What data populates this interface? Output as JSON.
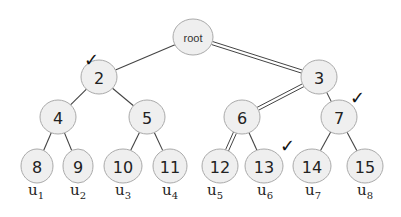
{
  "diagram": {
    "type": "binary-tree",
    "colors": {
      "node_fill": "#efefef",
      "node_stroke": "#aaaaaa",
      "edge": "#444444",
      "text": "#222222"
    },
    "nodes": [
      {
        "id": "root",
        "label": "root",
        "x": 193,
        "y": 37,
        "rx": 20,
        "ry": 18
      },
      {
        "id": "n2",
        "label": "2",
        "x": 99,
        "y": 77,
        "rx": 18,
        "ry": 17
      },
      {
        "id": "n3",
        "label": "3",
        "x": 319,
        "y": 77,
        "rx": 18,
        "ry": 17
      },
      {
        "id": "n4",
        "label": "4",
        "x": 58,
        "y": 117,
        "rx": 18,
        "ry": 17
      },
      {
        "id": "n5",
        "label": "5",
        "x": 147,
        "y": 117,
        "rx": 18,
        "ry": 17
      },
      {
        "id": "n6",
        "label": "6",
        "x": 242,
        "y": 117,
        "rx": 18,
        "ry": 17
      },
      {
        "id": "n7",
        "label": "7",
        "x": 339,
        "y": 117,
        "rx": 18,
        "ry": 17
      },
      {
        "id": "n8",
        "label": "8",
        "x": 37,
        "y": 166,
        "rx": 16,
        "ry": 17
      },
      {
        "id": "n9",
        "label": "9",
        "x": 78,
        "y": 166,
        "rx": 15,
        "ry": 17
      },
      {
        "id": "n10",
        "label": "10",
        "x": 123,
        "y": 166,
        "rx": 19,
        "ry": 17
      },
      {
        "id": "n11",
        "label": "11",
        "x": 170,
        "y": 166,
        "rx": 17,
        "ry": 17
      },
      {
        "id": "n12",
        "label": "12",
        "x": 220,
        "y": 166,
        "rx": 18,
        "ry": 17
      },
      {
        "id": "n13",
        "label": "13",
        "x": 264,
        "y": 166,
        "rx": 19,
        "ry": 17
      },
      {
        "id": "n14",
        "label": "14",
        "x": 312,
        "y": 166,
        "rx": 19,
        "ry": 17
      },
      {
        "id": "n15",
        "label": "15",
        "x": 365,
        "y": 166,
        "rx": 18,
        "ry": 17
      }
    ],
    "edges": [
      {
        "from": "root",
        "to": "n2",
        "double": false
      },
      {
        "from": "root",
        "to": "n3",
        "double": true
      },
      {
        "from": "n2",
        "to": "n4",
        "double": false
      },
      {
        "from": "n2",
        "to": "n5",
        "double": false
      },
      {
        "from": "n3",
        "to": "n6",
        "double": true
      },
      {
        "from": "n3",
        "to": "n7",
        "double": false
      },
      {
        "from": "n4",
        "to": "n8",
        "double": false
      },
      {
        "from": "n4",
        "to": "n9",
        "double": false
      },
      {
        "from": "n5",
        "to": "n10",
        "double": false
      },
      {
        "from": "n5",
        "to": "n11",
        "double": false
      },
      {
        "from": "n6",
        "to": "n12",
        "double": true
      },
      {
        "from": "n6",
        "to": "n13",
        "double": false
      },
      {
        "from": "n7",
        "to": "n14",
        "double": false
      },
      {
        "from": "n7",
        "to": "n15",
        "double": false
      }
    ],
    "leaf_labels": [
      {
        "node": "n8",
        "base": "u",
        "sub": "1",
        "x": 28,
        "y": 195
      },
      {
        "node": "n9",
        "base": "u",
        "sub": "2",
        "x": 70,
        "y": 195
      },
      {
        "node": "n10",
        "base": "u",
        "sub": "3",
        "x": 115,
        "y": 195
      },
      {
        "node": "n11",
        "base": "u",
        "sub": "4",
        "x": 162,
        "y": 195
      },
      {
        "node": "n12",
        "base": "u",
        "sub": "5",
        "x": 207,
        "y": 195
      },
      {
        "node": "n13",
        "base": "u",
        "sub": "6",
        "x": 257,
        "y": 195
      },
      {
        "node": "n14",
        "base": "u",
        "sub": "7",
        "x": 305,
        "y": 195
      },
      {
        "node": "n15",
        "base": "u",
        "sub": "8",
        "x": 357,
        "y": 195
      }
    ],
    "checkmarks": [
      {
        "near": "n2",
        "symbol": "✓",
        "x": 84,
        "y": 66
      },
      {
        "near": "n7",
        "symbol": "✓",
        "x": 350,
        "y": 104
      },
      {
        "near": "n13",
        "symbol": "✓",
        "x": 280,
        "y": 152
      }
    ]
  }
}
